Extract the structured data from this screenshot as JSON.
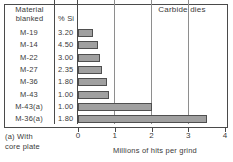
{
  "figure": {
    "title": "Carbide dies",
    "footnote": "(a) With\ncore plate",
    "columns": {
      "material": "Material\nblanked",
      "si": "% Si"
    }
  },
  "chart_data": {
    "type": "bar",
    "orientation": "horizontal",
    "title": "Carbide dies",
    "xlabel": "Millions of hits per grind",
    "ylabel": "",
    "xlim": [
      0,
      4
    ],
    "xticks": [
      "0",
      "1",
      "2",
      "3",
      "4"
    ],
    "grid": true,
    "legend": "none",
    "categories": [
      "M-19",
      "M-14",
      "M-22",
      "M-27",
      "M-36",
      "M-43",
      "M-43(a)",
      "M-36(a)"
    ],
    "values": [
      0.42,
      0.55,
      0.6,
      0.64,
      0.8,
      0.85,
      2.0,
      3.5
    ],
    "percent_si": [
      "3.20",
      "4.50",
      "3.00",
      "2.35",
      "1.80",
      "1.00",
      "1.00",
      "1.80"
    ],
    "rows": [
      {
        "material": "M-19",
        "si": "3.20",
        "value": 0.42
      },
      {
        "material": "M-14",
        "si": "4.50",
        "value": 0.55
      },
      {
        "material": "M-22",
        "si": "3.00",
        "value": 0.6
      },
      {
        "material": "M-27",
        "si": "2.35",
        "value": 0.64
      },
      {
        "material": "M-36",
        "si": "1.80",
        "value": 0.8
      },
      {
        "material": "M-43",
        "si": "1.00",
        "value": 0.85
      },
      {
        "material": "M-43(a)",
        "si": "1.00",
        "value": 2.0
      },
      {
        "material": "M-36(a)",
        "si": "1.80",
        "value": 3.5
      }
    ],
    "colors": {
      "bar_fill": "#a0a0a0",
      "bar_edge": "#4f4f4f",
      "frame": "#4a4a4a",
      "grid": "#8e8e8e",
      "text": "#3a3a3a",
      "background": "#ffffff"
    }
  }
}
